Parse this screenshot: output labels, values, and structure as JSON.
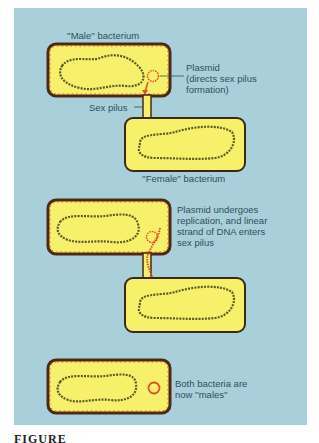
{
  "figure": {
    "background_color": "#a9cfdb",
    "cell_fill": "#f7f06a",
    "cell_border": "#4a2a14",
    "plasmid_color": "#e0502a",
    "chromosome_color": "#5a5a2a",
    "caption_fragment": "FIGURE"
  },
  "stage1": {
    "male_label": "''Male'' bacterium",
    "plasmid_label": "Plasmid\n(directs sex pilus\nformation)",
    "pilus_label": "Sex pilus",
    "female_label": "''Female'' bacterium"
  },
  "stage2": {
    "description": "Plasmid undergoes\nreplication, and linear\nstrand of DNA enters\nsex pilus"
  },
  "stage3": {
    "description": "Both bacteria are\nnow ''males''"
  }
}
